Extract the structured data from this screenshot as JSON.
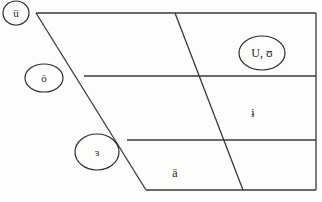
{
  "diagram": {
    "type": "vowel-chart-trapezoid",
    "line_color": "#3a3a3a",
    "background": "#fdfdfc",
    "circled_vowels": [
      {
        "id": "u-umlaut",
        "label": "ü",
        "cx": 16,
        "cy": 13,
        "rx": 13,
        "ry": 12
      },
      {
        "id": "o-umlaut",
        "label": "ö",
        "cx": 44,
        "cy": 78,
        "rx": 19,
        "ry": 14
      },
      {
        "id": "open-mid-central",
        "label": "ɜ",
        "cx": 97,
        "cy": 152,
        "rx": 22,
        "ry": 18
      },
      {
        "id": "upsilon",
        "label": "U, ʊ",
        "cx": 262,
        "cy": 53,
        "rx": 23,
        "ry": 17
      }
    ],
    "plain_vowels": [
      {
        "id": "barred-i",
        "label": "ɨ",
        "x": 253,
        "y": 113
      },
      {
        "id": "a-umlaut",
        "label": "ä",
        "x": 175,
        "y": 173
      }
    ]
  }
}
